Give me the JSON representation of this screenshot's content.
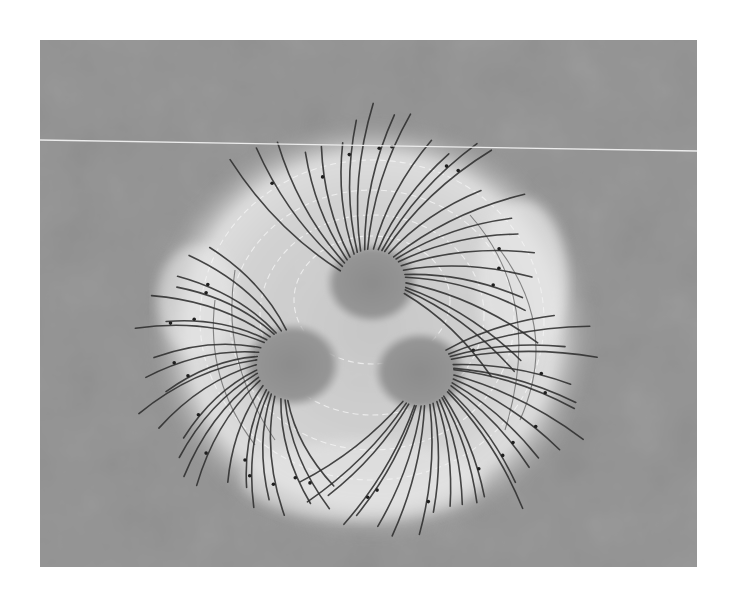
{
  "image": {
    "kind": "grayscale aerial photograph of a field-line pattern laid out on the ground",
    "canvas": {
      "width": 731,
      "height": 607,
      "background": "#ffffff"
    },
    "photo": {
      "x": 40,
      "y": 40,
      "width": 657,
      "height": 527
    }
  },
  "colors": {
    "ground": "#9a9a9a",
    "ground_dark": "#8a8a8a",
    "halo": "#d8d8d8",
    "halo_bright": "#e6e6e6",
    "blob": "#8e8e8e",
    "field_line": "#2e2e2e",
    "dashed_arc": "#f2f2f2",
    "horizon_line": "#ececec",
    "marker": "#1e1e1e"
  },
  "horizon_line": {
    "x1": 40,
    "y1": 140,
    "x2": 697,
    "y2": 151
  },
  "halo": {
    "cx": 372,
    "cy": 330,
    "rx": 195,
    "ry": 185
  },
  "sources": [
    {
      "name": "upper",
      "cx": 372,
      "cy": 283,
      "r": 40,
      "lines": 26,
      "length": 135,
      "curl": 0.35,
      "start_angle": -160,
      "end_angle": 20
    },
    {
      "name": "left",
      "cx": 292,
      "cy": 365,
      "r": 42,
      "lines": 24,
      "length": 110,
      "curl": -0.45,
      "start_angle": 95,
      "end_angle": 260
    },
    {
      "name": "right",
      "cx": 420,
      "cy": 372,
      "r": 40,
      "lines": 26,
      "length": 128,
      "curl": 0.3,
      "start_angle": -40,
      "end_angle": 120
    }
  ],
  "dashed_arcs": [
    {
      "cx": 372,
      "cy": 320,
      "rx": 172,
      "ry": 160
    },
    {
      "cx": 372,
      "cy": 320,
      "rx": 142,
      "ry": 130
    },
    {
      "cx": 372,
      "cy": 315,
      "rx": 112,
      "ry": 100
    },
    {
      "cx": 372,
      "cy": 300,
      "rx": 78,
      "ry": 64
    }
  ],
  "equipotential_arcs": [
    {
      "d": "M 470 215 Q 545 300 505 430"
    },
    {
      "d": "M 500 250 Q 560 330 520 420"
    },
    {
      "d": "M 215 300 Q 205 380 255 445"
    },
    {
      "d": "M 235 270 Q 220 360 275 440"
    }
  ]
}
